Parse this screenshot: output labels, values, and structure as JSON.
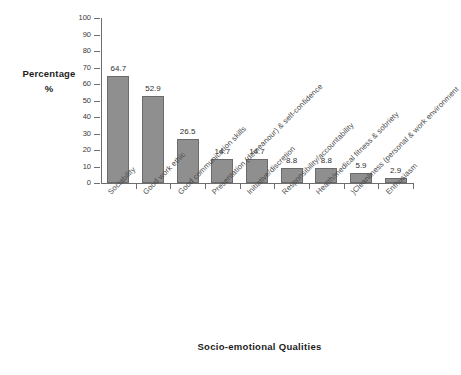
{
  "chart_data": {
    "type": "bar",
    "title": "",
    "xlabel": "Socio-emotional Qualities",
    "ylabel": "Percentage",
    "ylabel_line2": "%",
    "ylim": [
      0,
      100
    ],
    "yticks": [
      0,
      10,
      20,
      30,
      40,
      50,
      60,
      70,
      80,
      90,
      100
    ],
    "grid": false,
    "legend": "none",
    "bar_color": "#8f8f8f",
    "bar_border_color": "#6b6b6b",
    "categories": [
      "Sociability",
      "Good work ethic",
      "Good communication skills",
      "Presentation (demeanour) & self-confidence",
      "Initiative/discretion",
      "Responsibility/accountability",
      "Health/medical fitness & sobriety",
      ")Cleanliness (personal & work environment",
      "Enthusiasm"
    ],
    "values": [
      64.7,
      52.9,
      26.5,
      14.7,
      14.7,
      8.8,
      8.8,
      5.9,
      2.9
    ],
    "value_labels": [
      "64.7",
      "52.9",
      "26.5",
      "14.7",
      "14.7",
      "8.8",
      "8.8",
      "5.9",
      "2.9"
    ]
  }
}
